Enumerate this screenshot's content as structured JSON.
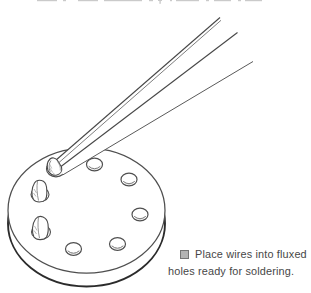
{
  "illustration": {
    "name": "wires-into-fluxed-disc",
    "description": "Line-art illustration of two long straight wires being inserted into the top-left hole of a round fluxed disc viewed in perspective; two left holes already contain wire ends; five other holes are empty.",
    "disc_hole_count": 8,
    "holes_with_wires": 3,
    "colors": {
      "line": "#474747",
      "line_dark": "#2b2b2b",
      "line_light": "#8a8a8a",
      "fill": "#ffffff",
      "hole_shade": "#dcdcdc",
      "artifact": "#b9b9b9"
    }
  },
  "caption": {
    "bullet_icon": "square-bullet",
    "bullet_color": "#b4b4b4",
    "text_color": "#474747",
    "line1": "Place wires into fluxed",
    "line2": "holes ready for soldering."
  }
}
